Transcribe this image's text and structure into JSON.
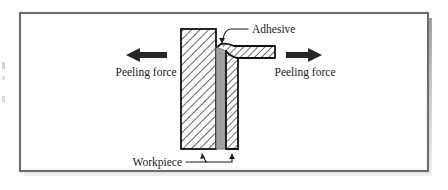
{
  "figure": {
    "frame": {
      "border_color": "#6e6e6e",
      "fill_color": "#ffffff",
      "shadow_color": "#9a9a9a"
    },
    "labels": {
      "adhesive": "Adhesive",
      "workpiece": "Workpiece",
      "peeling_force_left": "Peeling force",
      "peeling_force_right": "Peeling force"
    },
    "icons": {
      "left_arrow": "arrow-left-icon",
      "right_arrow": "arrow-right-icon"
    },
    "colors": {
      "hatch_line": "#3d3d3d",
      "part_outline": "#111111",
      "adhesive_fill": "#9e9e9e",
      "arrow_fill": "#262626",
      "leader_line": "#1a1a1a"
    },
    "parts": [
      {
        "name": "workpiece-left",
        "kind": "hatched-block",
        "description": "Large vertical hatched workpiece on the left side of the joint"
      },
      {
        "name": "workpiece-right",
        "kind": "hatched-block",
        "description": "Narrow vertical workpiece that bends out to the right at the top, being peeled away"
      },
      {
        "name": "adhesive-layer",
        "kind": "solid-gray-strip",
        "description": "Gray adhesive bond line between the two workpieces"
      }
    ]
  }
}
